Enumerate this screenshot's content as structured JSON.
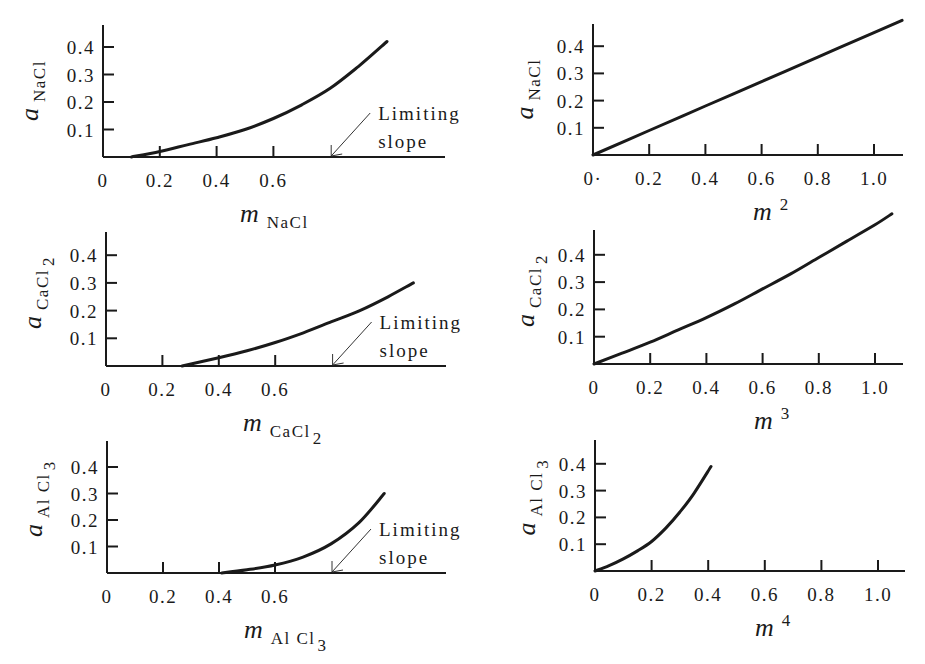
{
  "figure": {
    "panels_layout": "3 rows x 2 columns"
  },
  "chart_data": [
    {
      "id": "nacl_vs_m",
      "type": "line",
      "xlabel": "m",
      "xlabel_sub": "NaCl",
      "ylabel": "a",
      "ylabel_sub": "NaCl",
      "x_ticks": [
        "0",
        "0.2",
        "0.4",
        "0.6"
      ],
      "x_tick_values": [
        0,
        0.2,
        0.4,
        0.6
      ],
      "y_ticks": [
        "0.1",
        "0.2",
        "0.3",
        "0.4"
      ],
      "y_tick_values": [
        0.1,
        0.2,
        0.3,
        0.4
      ],
      "xlim": [
        0,
        1.2
      ],
      "ylim": [
        0,
        0.48
      ],
      "annotation": {
        "line1": "Limiting",
        "line2": "slope",
        "arrow_to_x": 0.8
      },
      "x": [
        0.1,
        0.2,
        0.3,
        0.4,
        0.5,
        0.6,
        0.7,
        0.8,
        0.9,
        1.0
      ],
      "y": [
        0.0,
        0.02,
        0.045,
        0.07,
        0.1,
        0.14,
        0.19,
        0.25,
        0.33,
        0.42
      ],
      "px": {
        "x0": 103,
        "y0": 157,
        "xscale": 284,
        "yscale": 275,
        "ytop": 25,
        "xend": 445
      }
    },
    {
      "id": "nacl_vs_m2",
      "type": "line",
      "xlabel": "m",
      "xlabel_sup": "2",
      "ylabel": "a",
      "ylabel_sub": "NaCl",
      "x_ticks": [
        "0·",
        "0.2",
        "0.4",
        "0.6",
        "0.8",
        "1.0"
      ],
      "x_tick_values": [
        0,
        0.2,
        0.4,
        0.6,
        0.8,
        1.0
      ],
      "y_ticks": [
        "0.1",
        "0.2",
        "0.3",
        "0.4"
      ],
      "y_tick_values": [
        0.1,
        0.2,
        0.3,
        0.4
      ],
      "xlim": [
        0,
        1.1
      ],
      "ylim": [
        0,
        0.5
      ],
      "x": [
        0,
        0.2,
        0.4,
        0.6,
        0.8,
        1.0,
        1.1
      ],
      "y": [
        0,
        0.09,
        0.18,
        0.27,
        0.36,
        0.45,
        0.495
      ],
      "px": {
        "x0": 593,
        "y0": 155,
        "xscale": 281,
        "yscale": 272,
        "ytop": 24,
        "xend": 903
      }
    },
    {
      "id": "cacl2_vs_m",
      "type": "line",
      "xlabel": "m",
      "xlabel_sub": "CaCl",
      "xlabel_sub2": "2",
      "ylabel": "a",
      "ylabel_sub": "CaCl",
      "ylabel_sub2": "2",
      "x_ticks": [
        "0",
        "0.2",
        "0.4",
        "0.6"
      ],
      "x_tick_values": [
        0,
        0.2,
        0.4,
        0.6
      ],
      "y_ticks": [
        "0.1",
        "0.2",
        "0.3",
        "0.4"
      ],
      "y_tick_values": [
        0.1,
        0.2,
        0.3,
        0.4
      ],
      "xlim": [
        0,
        1.2
      ],
      "ylim": [
        0,
        0.48
      ],
      "annotation": {
        "line1": "Limiting",
        "line2": "slope",
        "arrow_to_x": 0.8
      },
      "x": [
        0.27,
        0.4,
        0.5,
        0.6,
        0.7,
        0.8,
        0.9,
        1.0,
        1.09
      ],
      "y": [
        0.0,
        0.03,
        0.055,
        0.085,
        0.12,
        0.16,
        0.2,
        0.25,
        0.3
      ],
      "px": {
        "x0": 106,
        "y0": 366,
        "xscale": 282,
        "yscale": 277,
        "ytop": 232,
        "xend": 446
      }
    },
    {
      "id": "cacl2_vs_m3",
      "type": "line",
      "xlabel": "m",
      "xlabel_sup": "3",
      "ylabel": "a",
      "ylabel_sub": "CaCl",
      "ylabel_sub2": "2",
      "x_ticks": [
        "0",
        "0.2",
        "0.4",
        "0.6",
        "0.8",
        "1.0"
      ],
      "x_tick_values": [
        0,
        0.2,
        0.4,
        0.6,
        0.8,
        1.0
      ],
      "y_ticks": [
        "0.1",
        "0.2",
        "0.3",
        "0.4"
      ],
      "y_tick_values": [
        0.1,
        0.2,
        0.3,
        0.4
      ],
      "xlim": [
        0,
        1.1
      ],
      "ylim": [
        0,
        0.55
      ],
      "x": [
        0,
        0.1,
        0.2,
        0.3,
        0.4,
        0.5,
        0.6,
        0.7,
        0.8,
        0.9,
        1.0,
        1.06
      ],
      "y": [
        0,
        0.04,
        0.08,
        0.125,
        0.17,
        0.22,
        0.275,
        0.33,
        0.39,
        0.45,
        0.51,
        0.55
      ],
      "px": {
        "x0": 594,
        "y0": 364,
        "xscale": 281,
        "yscale": 273,
        "ytop": 230,
        "xend": 903
      }
    },
    {
      "id": "alcl3_vs_m",
      "type": "line",
      "xlabel": "m",
      "xlabel_sub": "Al Cl",
      "xlabel_sub2": "3",
      "ylabel": "a",
      "ylabel_sub": "Al Cl",
      "ylabel_sub2": "3",
      "x_ticks": [
        "0",
        "0.2",
        "0.4",
        "0.6"
      ],
      "x_tick_values": [
        0,
        0.2,
        0.4,
        0.6
      ],
      "y_ticks": [
        "0.1",
        "0.2",
        "0.3",
        "0.4"
      ],
      "y_tick_values": [
        0.1,
        0.2,
        0.3,
        0.4
      ],
      "xlim": [
        0,
        1.2
      ],
      "ylim": [
        0,
        0.48
      ],
      "annotation": {
        "line1": "Limiting",
        "line2": "slope",
        "arrow_to_x": 0.8
      },
      "x": [
        0.41,
        0.5,
        0.6,
        0.7,
        0.8,
        0.9,
        0.99
      ],
      "y": [
        0.0,
        0.012,
        0.03,
        0.06,
        0.11,
        0.19,
        0.3
      ],
      "px": {
        "x0": 107,
        "y0": 573,
        "xscale": 280,
        "yscale": 265,
        "ytop": 441,
        "xend": 446
      }
    },
    {
      "id": "alcl3_vs_m4",
      "type": "line",
      "xlabel": "m",
      "xlabel_sup": "4",
      "ylabel": "a",
      "ylabel_sub": "Al Cl",
      "ylabel_sub2": "3",
      "x_ticks": [
        "0",
        "0.2",
        "0.4",
        "0.6",
        "0.8",
        "1.0"
      ],
      "x_tick_values": [
        0,
        0.2,
        0.4,
        0.6,
        0.8,
        1.0
      ],
      "y_ticks": [
        "0.1",
        "0.2",
        "0.3",
        "0.4"
      ],
      "y_tick_values": [
        0.1,
        0.2,
        0.3,
        0.4
      ],
      "xlim": [
        0,
        1.1
      ],
      "ylim": [
        0,
        0.48
      ],
      "x": [
        0,
        0.05,
        0.1,
        0.15,
        0.2,
        0.25,
        0.3,
        0.35,
        0.41
      ],
      "y": [
        0,
        0.02,
        0.045,
        0.075,
        0.11,
        0.16,
        0.22,
        0.29,
        0.39
      ],
      "px": {
        "x0": 595,
        "y0": 571,
        "xscale": 283,
        "yscale": 268,
        "ytop": 440,
        "xend": 905
      }
    }
  ]
}
